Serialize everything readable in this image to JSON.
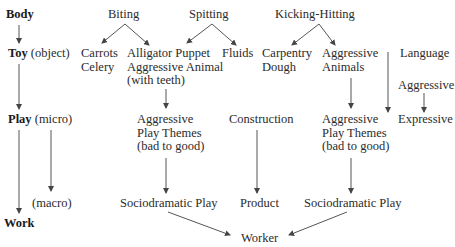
{
  "levels": {
    "body": {
      "bold": "Body",
      "rest": ""
    },
    "toy": {
      "bold": "Toy",
      "rest": " (object)"
    },
    "play": {
      "bold": "Play",
      "rest": " (micro)"
    },
    "macro": "(macro)",
    "work": {
      "bold": "Work",
      "rest": ""
    }
  },
  "top": {
    "biting": "Biting",
    "spitting": "Spitting",
    "kicking": "Kicking-Hitting"
  },
  "toys": {
    "carrots": "Carrots\nCelery",
    "alligator": "Alligator Puppet\nAggressive Animal\n(with teeth)",
    "fluids": "Fluids",
    "carpentry": "Carpentry\nDough",
    "aggressive_animals": "Aggressive\nAnimals",
    "language": "Language",
    "aggressive": "Aggressive"
  },
  "play": {
    "themes_left": "Aggressive\nPlay Themes\n(bad to good)",
    "construction": "Construction",
    "themes_right": "Aggressive\nPlay Themes\n(bad to good)",
    "expressive": "Expressive"
  },
  "outcomes": {
    "socio_left": "Sociodramatic Play",
    "product": "Product",
    "socio_right": "Sociodramatic Play"
  },
  "final": {
    "worker": "Worker"
  },
  "colors": {
    "text": "#2b2b2b",
    "line": "#444444"
  }
}
